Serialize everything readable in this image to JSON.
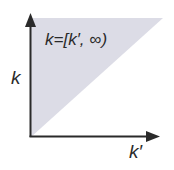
{
  "diagram": {
    "region_label": "k=[k′, ∞)",
    "y_axis_label": "k",
    "x_axis_label": "k′",
    "colors": {
      "region_fill": "#dcdce6",
      "axis": "#2a2a2a",
      "background": "#ffffff"
    },
    "shaded_region": "triangle above the diagonal k = k′ (k ≥ k′)"
  }
}
